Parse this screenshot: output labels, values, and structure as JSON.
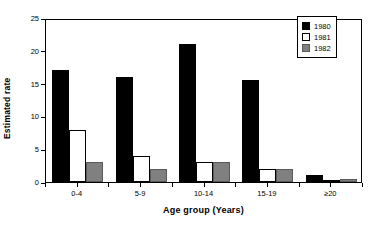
{
  "chart_data": {
    "type": "bar",
    "title": "",
    "xlabel": "Age group (Years)",
    "ylabel": "Estimated rate",
    "categories": [
      "0-4",
      "5-9",
      "10-14",
      "15-19",
      "≥20"
    ],
    "series": [
      {
        "name": "1980",
        "color": "#000000",
        "values": [
          17,
          16,
          21,
          15.5,
          1.1
        ]
      },
      {
        "name": "1981",
        "color": "#ffffff",
        "values": [
          8,
          4,
          3,
          2,
          0.3
        ]
      },
      {
        "name": "1982",
        "color": "#808080",
        "values": [
          3,
          2,
          3,
          2,
          0.5
        ]
      }
    ],
    "ylim": [
      0,
      25
    ],
    "yticks": [
      0,
      5,
      10,
      15,
      20,
      25
    ],
    "ytick_labels": [
      "0",
      "5",
      "10",
      "15",
      "20",
      "25"
    ],
    "grid": false,
    "legend_position": "top-right"
  },
  "legend": {
    "entries": [
      {
        "label": "1980"
      },
      {
        "label": "1981"
      },
      {
        "label": "1982"
      }
    ]
  }
}
